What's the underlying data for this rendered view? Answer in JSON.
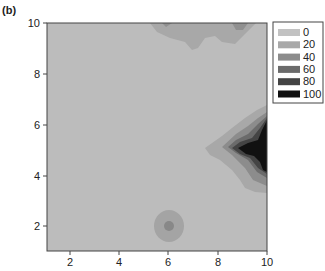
{
  "panel_label": "(b)",
  "chart_data": {
    "type": "heatmap",
    "subtype": "filled-contour",
    "title": "",
    "xlabel": "",
    "ylabel": "",
    "xlim": [
      1,
      10
    ],
    "ylim": [
      1,
      10
    ],
    "x_ticks": [
      2,
      4,
      6,
      8,
      10
    ],
    "y_ticks": [
      2,
      4,
      6,
      8,
      10
    ],
    "grid": false,
    "legend_position": "right-top",
    "levels": [
      0,
      20,
      40,
      60,
      80,
      100
    ],
    "level_colors": [
      "#c2c2c2",
      "#a8a8a8",
      "#8c8c8c",
      "#6b6b6b",
      "#444444",
      "#111111"
    ],
    "features": [
      {
        "description": "Strong peak at right edge",
        "center": [
          9.8,
          5.0
        ],
        "max_level": 100,
        "extent_x": [
          7.6,
          10
        ],
        "extent_y": [
          3.3,
          6.7
        ]
      },
      {
        "description": "Moderate band along top edge",
        "center": [
          7.5,
          9.8
        ],
        "max_level": 40,
        "extent_x": [
          5.3,
          9.5
        ],
        "extent_y": [
          9.0,
          10
        ]
      },
      {
        "description": "Small local bump",
        "center": [
          6.0,
          2.0
        ],
        "max_level": 40,
        "extent_x": [
          5.5,
          6.5
        ],
        "extent_y": [
          1.5,
          2.6
        ]
      }
    ],
    "background_level": 0
  },
  "legend": {
    "entries": [
      {
        "label": "0",
        "color": "#c2c2c2"
      },
      {
        "label": "20",
        "color": "#a8a8a8"
      },
      {
        "label": "40",
        "color": "#8c8c8c"
      },
      {
        "label": "60",
        "color": "#6b6b6b"
      },
      {
        "label": "80",
        "color": "#444444"
      },
      {
        "label": "100",
        "color": "#111111"
      }
    ]
  },
  "axes": {
    "x_tick_labels": [
      "2",
      "4",
      "6",
      "8",
      "10"
    ],
    "y_tick_labels": [
      "2",
      "4",
      "6",
      "8",
      "10"
    ]
  }
}
